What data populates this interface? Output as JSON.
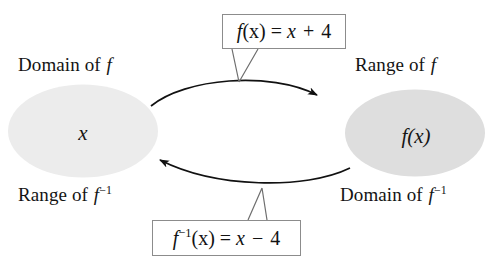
{
  "diagram": {
    "background_color": "#ffffff",
    "sets": {
      "left": {
        "element_label": "x",
        "fill_color": "#ececec",
        "top_label_prefix": "Domain of ",
        "top_label_var": "f",
        "bottom_label_prefix": "Range of ",
        "bottom_label_var": "f",
        "bottom_label_exponent": "−1"
      },
      "right": {
        "element_label": "f(x)",
        "fill_color": "#dedede",
        "top_label_prefix": "Range of ",
        "top_label_var": "f",
        "bottom_label_prefix": "Domain of ",
        "bottom_label_var": "f",
        "bottom_label_exponent": "−1"
      }
    },
    "formulas": {
      "forward": {
        "func_name": "f",
        "arg": "(x) = ",
        "rhs_var": "x",
        "operator": " + ",
        "constant": "4",
        "full_text": "f(x) = x + 4"
      },
      "inverse": {
        "func_name": "f",
        "exponent": "−1",
        "arg": "(x) = ",
        "rhs_var": "x",
        "operator": " − ",
        "constant": "4",
        "full_text": "f⁻¹(x) = x − 4"
      }
    },
    "arrows": {
      "forward_direction": "left-to-right",
      "inverse_direction": "right-to-left",
      "stroke_color": "#111111"
    }
  }
}
